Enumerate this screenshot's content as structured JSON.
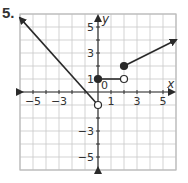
{
  "problem": {
    "number": "5."
  },
  "chart_data": {
    "type": "line",
    "title": "",
    "xlabel": "x",
    "ylabel": "y",
    "xlim": [
      -6,
      6
    ],
    "ylim": [
      -6,
      6
    ],
    "grid": true,
    "x_tick_labels": [
      "-5",
      "-3",
      "1",
      "3",
      "5"
    ],
    "y_tick_labels": [
      "5",
      "3",
      "1",
      "-3",
      "-5"
    ],
    "origin_label": "0",
    "series": [
      {
        "name": "piece-1",
        "kind": "ray",
        "start": [
          0,
          -1
        ],
        "start_closed": false,
        "direction_through": [
          -6,
          5.7
        ],
        "description": "y = -x - 1 for x < 0"
      },
      {
        "name": "piece-2",
        "kind": "segment",
        "start": [
          0,
          1
        ],
        "start_closed": true,
        "end": [
          2,
          1
        ],
        "end_closed": false,
        "description": "y = 1 for 0 <= x < 2"
      },
      {
        "name": "piece-3",
        "kind": "ray",
        "start": [
          2,
          2
        ],
        "start_closed": true,
        "direction_through": [
          6,
          4
        ],
        "description": "y = 0.5x + 1 for x >= 2"
      }
    ]
  },
  "colors": {
    "grid": "#c8c8c8",
    "axis": "#333333",
    "line": "#2a2a2a",
    "border": "#bbbbbb"
  }
}
